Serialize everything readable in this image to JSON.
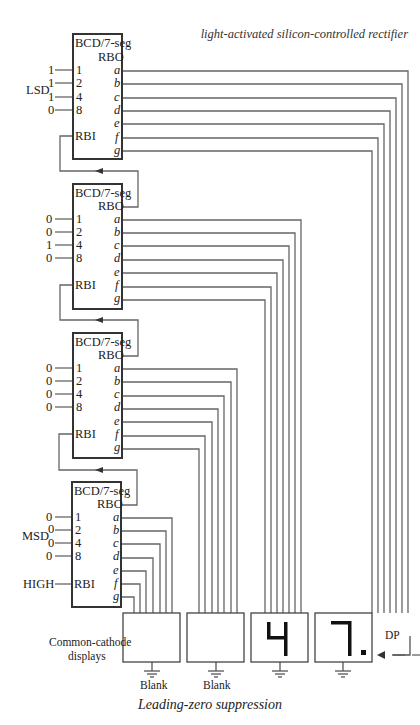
{
  "header": {
    "title": "light-activated silicon-controlled rectifier"
  },
  "decoders": [
    {
      "id": "decoder-1",
      "title": "BCD/7-seg",
      "rbo": "RBO",
      "rbi": "RBI",
      "inputs": [
        {
          "pin": "1",
          "value": "1"
        },
        {
          "pin": "2",
          "value": "1"
        },
        {
          "pin": "4",
          "value": "1"
        },
        {
          "pin": "8",
          "value": "0"
        }
      ],
      "group_label": "LSD",
      "rbi_input": ""
    },
    {
      "id": "decoder-2",
      "title": "BCD/7-seg",
      "rbo": "RBO",
      "rbi": "RBI",
      "inputs": [
        {
          "pin": "1",
          "value": "0"
        },
        {
          "pin": "2",
          "value": "0"
        },
        {
          "pin": "4",
          "value": "1"
        },
        {
          "pin": "8",
          "value": "0"
        }
      ],
      "group_label": "",
      "rbi_input": ""
    },
    {
      "id": "decoder-3",
      "title": "BCD/7-seg",
      "rbo": "RBO",
      "rbi": "RBI",
      "inputs": [
        {
          "pin": "1",
          "value": "0"
        },
        {
          "pin": "2",
          "value": "0"
        },
        {
          "pin": "4",
          "value": "0"
        },
        {
          "pin": "8",
          "value": "0"
        }
      ],
      "group_label": "",
      "rbi_input": ""
    },
    {
      "id": "decoder-4",
      "title": "BCD/7-seg",
      "rbo": "RBO",
      "rbi": "RBI",
      "inputs": [
        {
          "pin": "1",
          "value": "0"
        },
        {
          "pin": "2",
          "value": "0"
        },
        {
          "pin": "4",
          "value": "0"
        },
        {
          "pin": "8",
          "value": "0"
        }
      ],
      "group_label": "MSD",
      "rbi_input": "HIGH"
    }
  ],
  "segments": [
    "a",
    "b",
    "c",
    "d",
    "e",
    "f",
    "g"
  ],
  "displays": {
    "label_line1": "Common-cathode",
    "label_line2": "displays",
    "items": [
      {
        "digit": "",
        "caption": "Blank"
      },
      {
        "digit": "",
        "caption": "Blank"
      },
      {
        "digit": "4",
        "caption": ""
      },
      {
        "digit": "7.",
        "caption": ""
      }
    ],
    "dp_label": "DP"
  },
  "caption": "Leading-zero suppression",
  "colors": {
    "line": "#555555",
    "box": "#333333",
    "segment": "#111111"
  }
}
